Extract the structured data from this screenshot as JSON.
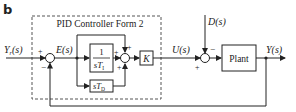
{
  "panel_label": "b",
  "controller": {
    "title": "PID Controller Form 2",
    "integral_block": {
      "numerator": "1",
      "denominator_s": "sT",
      "denominator_sub": "I"
    },
    "derivative_block": {
      "text": "sT",
      "sub": "D"
    },
    "gain_block": "K"
  },
  "signals": {
    "reference": "Y",
    "reference_sub": "r",
    "reference_arg": "(s)",
    "error": "E(s)",
    "control": "U(s)",
    "disturbance": "D(s)",
    "output": "Y(s)"
  },
  "plant": {
    "label": "Plant"
  },
  "signs": {
    "sum1_ref": "+",
    "sum1_fb": "−",
    "sum2_top": "+",
    "sum2_left": "+",
    "sum2_bottom": "+",
    "sum3_dist": "−",
    "sum3_ctrl": "+"
  },
  "colors": {
    "line": "#333333",
    "dash": "#555555",
    "text": "#222222"
  }
}
